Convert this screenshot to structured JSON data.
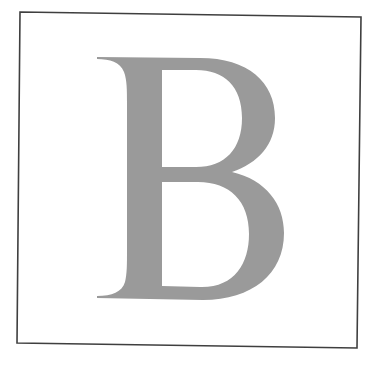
{
  "figure": {
    "letter": "B",
    "colors": {
      "background": "#ffffff",
      "frame": "#3f3f3f",
      "letter_fill": "#9a9a9a"
    }
  }
}
